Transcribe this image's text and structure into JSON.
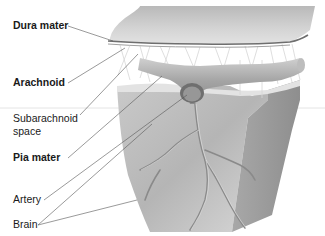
{
  "figure": {
    "colors": {
      "background": "#ffffff",
      "dura": "#c8c8c8",
      "dura_edge": "#6e6e6e",
      "arachnoid_web": "#e6e6e6",
      "artery": "#a9a9a9",
      "brain_front": "#bdbdbd",
      "brain_side": "#9a9a9a",
      "leader_line": "#555555",
      "label_text": "#1a1a1a"
    }
  },
  "labels": [
    {
      "id": "dura-mater",
      "text": "Dura mater",
      "bold": true
    },
    {
      "id": "arachnoid",
      "text": "Arachnoid",
      "bold": true
    },
    {
      "id": "subarachnoid-space",
      "text": "Subarachnoid space",
      "bold": false
    },
    {
      "id": "pia-mater",
      "text": "Pia mater",
      "bold": true
    },
    {
      "id": "artery",
      "text": "Artery",
      "bold": false
    },
    {
      "id": "brain",
      "text": "Brain",
      "bold": false
    }
  ]
}
